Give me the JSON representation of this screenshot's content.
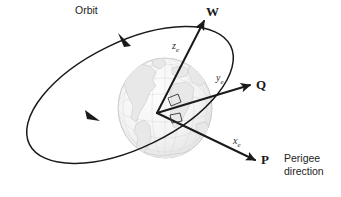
{
  "figure": {
    "background_color": "#ffffff",
    "line_color": "#1a1a1a",
    "globe_fill": "#f2f2f2",
    "globe_stroke": "#b9b9b9",
    "continent_color": "#cfcfcf",
    "text_color": "#1a1a1a"
  },
  "labels": {
    "orbit": "Orbit",
    "w_vector": "W",
    "q_vector": "Q",
    "p_vector": "P",
    "z_axis": "z",
    "z_axis_sub": "e",
    "y_axis": "y",
    "y_axis_sub": "e",
    "x_axis": "x",
    "x_axis_sub": "e",
    "perigee_direction": "Perigee\ndirection"
  },
  "geometry": {
    "origin": {
      "x": 157,
      "y": 113
    },
    "globe": {
      "cx": 165,
      "cy": 108,
      "rx": 47,
      "ry": 50
    },
    "orbit_ellipse": {
      "cx": 130,
      "cy": 95,
      "rx": 112,
      "ry": 53,
      "rotation_deg": -26
    },
    "vectors": [
      {
        "name": "W",
        "tip": {
          "x": 204,
          "y": 21
        }
      },
      {
        "name": "Q",
        "tip": {
          "x": 250,
          "y": 85
        }
      },
      {
        "name": "P",
        "tip": {
          "x": 255,
          "y": 160
        }
      }
    ],
    "orbit_direction_arrows": [
      {
        "x": 124,
        "y": 41
      },
      {
        "x": 93,
        "y": 117
      }
    ],
    "right_angle_markers": 2
  }
}
